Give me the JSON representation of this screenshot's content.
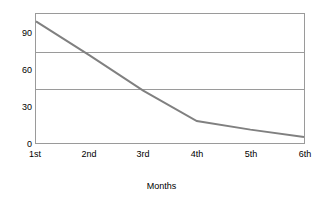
{
  "chart_data": {
    "type": "line",
    "title": "",
    "subtitle": "",
    "xlabel": "Months",
    "ylabel": "",
    "categories": [
      "1st",
      "2nd",
      "3rd",
      "4th",
      "5th",
      "6th"
    ],
    "series": [
      {
        "name": "Series 1",
        "values": [
          100,
          72,
          43,
          18,
          11,
          5
        ],
        "color": "#808080"
      }
    ],
    "ylim": [
      0,
      106
    ],
    "xlim": [
      0,
      5
    ],
    "y_ticks": [
      0,
      30,
      60,
      90
    ],
    "y_tick_labels": [
      "0",
      "30",
      "60",
      "90"
    ],
    "gridlines": {
      "show": true,
      "orientation": "horizontal",
      "values": [
        45,
        75
      ],
      "color": "#9a9a9a"
    },
    "legend": {
      "show": false,
      "position": "none",
      "entries": []
    },
    "axis": {
      "frame_color": "#9a9a9a",
      "show_frame": true
    },
    "annotations": []
  },
  "axis_labels": {
    "y": [
      "90",
      "60",
      "30",
      "0"
    ],
    "x": [
      "1st",
      "2nd",
      "3rd",
      "4th",
      "5th",
      "6th"
    ],
    "x_title": "Months"
  },
  "colors": {
    "background": "#ffffff",
    "line": "#808080",
    "grid": "#9a9a9a",
    "text": "#000000"
  }
}
